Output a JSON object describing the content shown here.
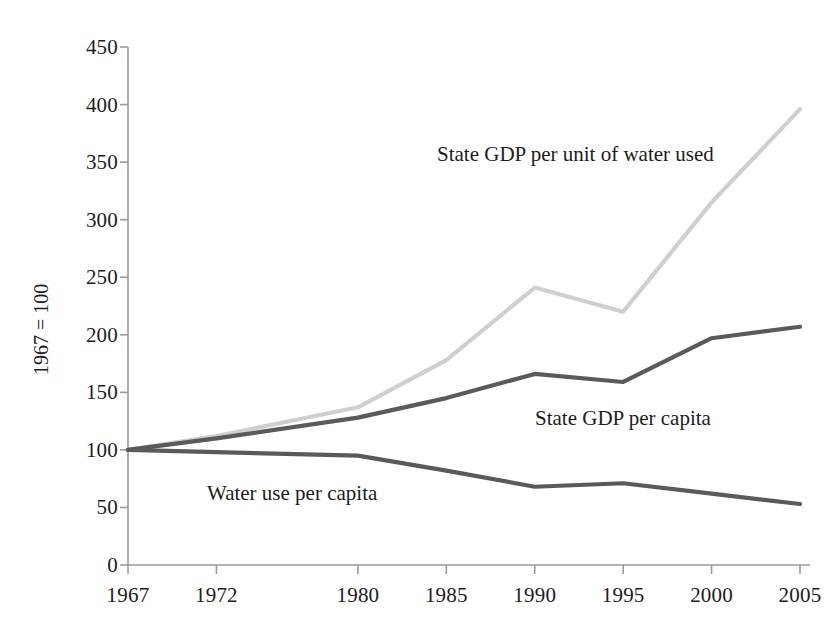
{
  "chart_data": {
    "type": "line",
    "title": "",
    "subtitle": "",
    "xlabel": "",
    "ylabel": "1967 = 100",
    "x": [
      1967,
      1972,
      1980,
      1985,
      1990,
      1995,
      2000,
      2005
    ],
    "xtick_labels": [
      "1967",
      "1972",
      "1980",
      "1985",
      "1990",
      "1995",
      "2000",
      "2005"
    ],
    "ytick_labels": [
      "0",
      "50",
      "100",
      "150",
      "200",
      "250",
      "300",
      "350",
      "400",
      "450"
    ],
    "yticks": [
      0,
      50,
      100,
      150,
      200,
      250,
      300,
      350,
      400,
      450
    ],
    "ylim": [
      0,
      450
    ],
    "xlim": [
      1967,
      2005
    ],
    "grid": false,
    "legend": "inline-annotations",
    "series": [
      {
        "name": "State GDP per unit of water used",
        "color": "#cfcfcf",
        "values": [
          100,
          112,
          137,
          178,
          241,
          220,
          315,
          396
        ]
      },
      {
        "name": "State GDP per capita",
        "color": "#5a5a5a",
        "values": [
          100,
          110,
          128,
          145,
          166,
          159,
          197,
          207
        ]
      },
      {
        "name": "Water use per capita",
        "color": "#5a5a5a",
        "values": [
          100,
          98,
          95,
          82,
          68,
          71,
          62,
          53
        ]
      }
    ],
    "annotations": [
      {
        "text": "State GDP per unit of water used",
        "x_px": 437,
        "y_px": 142
      },
      {
        "text": "State GDP per capita",
        "x_px": 535,
        "y_px": 406
      },
      {
        "text": "Water use per capita",
        "x_px": 207,
        "y_px": 481
      }
    ]
  },
  "axes": {
    "y_axis_title": "1967 = 100",
    "axis_color": "#9a9a9a"
  }
}
